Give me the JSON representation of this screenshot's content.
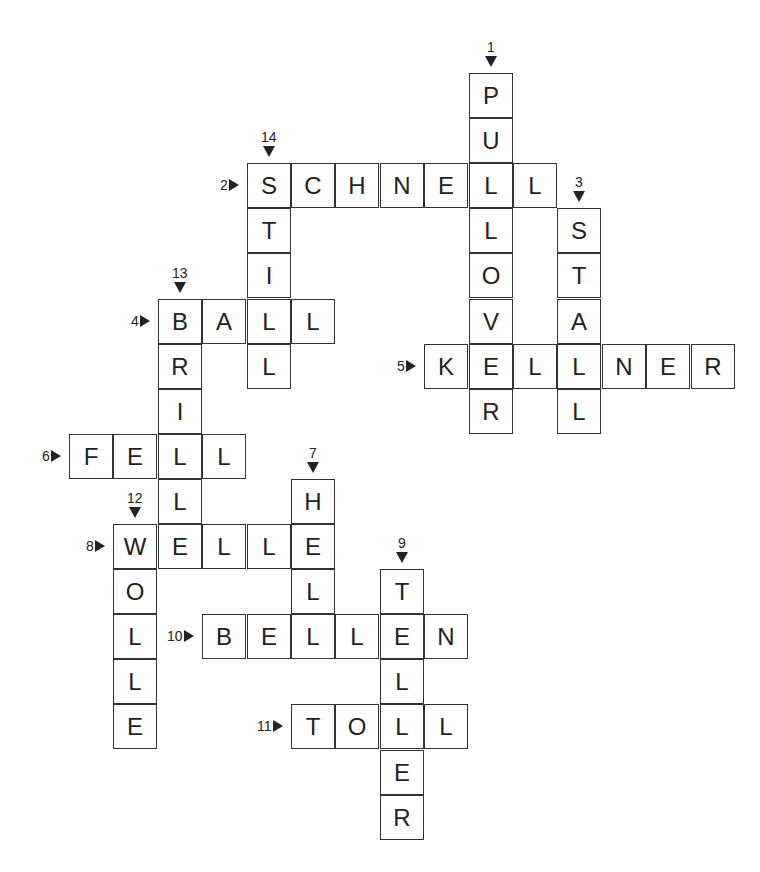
{
  "grid": {
    "x0": 69,
    "y0": 73,
    "col_step": 44.4,
    "row_step": 45.1
  },
  "words": [
    {
      "number": "1",
      "direction": "down",
      "word": "PULLOVER",
      "col": 9,
      "row": 0
    },
    {
      "number": "2",
      "direction": "across",
      "word": "SCHNELL",
      "col": 4,
      "row": 2
    },
    {
      "number": "3",
      "direction": "down",
      "word": "STALL",
      "col": 11,
      "row": 3
    },
    {
      "number": "4",
      "direction": "across",
      "word": "BALL",
      "col": 2,
      "row": 5
    },
    {
      "number": "5",
      "direction": "across",
      "word": "KELLNER",
      "col": 8,
      "row": 6
    },
    {
      "number": "6",
      "direction": "across",
      "word": "FELL",
      "col": 0,
      "row": 8
    },
    {
      "number": "7",
      "direction": "down",
      "word": "HELL",
      "col": 5,
      "row": 9
    },
    {
      "number": "8",
      "direction": "across",
      "word": "WELLE",
      "col": 1,
      "row": 10
    },
    {
      "number": "9",
      "direction": "down",
      "word": "TELLER",
      "col": 7,
      "row": 11
    },
    {
      "number": "10",
      "direction": "across",
      "word": "BELLEN",
      "col": 3,
      "row": 12
    },
    {
      "number": "11",
      "direction": "across",
      "word": "TOLL",
      "col": 5,
      "row": 14
    },
    {
      "number": "12",
      "direction": "down",
      "word": "WOLLE",
      "col": 1,
      "row": 10
    },
    {
      "number": "13",
      "direction": "down",
      "word": "BRILLE",
      "col": 2,
      "row": 5
    },
    {
      "number": "14",
      "direction": "down",
      "word": "STILL",
      "col": 4,
      "row": 2
    }
  ],
  "colors": {
    "border": "#333333",
    "text": "#222222",
    "background": "#ffffff"
  }
}
